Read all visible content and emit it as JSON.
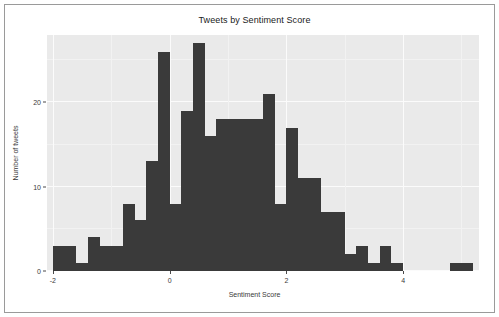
{
  "chart_data": {
    "type": "bar",
    "title": "Tweets by Sentiment Score",
    "xlabel": "Sentiment Score",
    "ylabel": "Number of tweets",
    "grid": true,
    "legend": null,
    "xlim": [
      -2.1,
      5.3
    ],
    "ylim": [
      0,
      28
    ],
    "xticks": [
      -2,
      0,
      2,
      4
    ],
    "xticklabels": [
      "-2",
      "0",
      "2",
      "4"
    ],
    "yticks": [
      0,
      10,
      20
    ],
    "yticklabels": [
      "0",
      "10",
      "20"
    ],
    "bin_width": 0.2,
    "bin_starts": [
      -2.0,
      -1.8,
      -1.6,
      -1.4,
      -1.2,
      -1.0,
      -0.8,
      -0.6,
      -0.4,
      -0.2,
      0.0,
      0.2,
      0.4,
      0.6,
      0.8,
      1.0,
      1.2,
      1.4,
      1.6,
      1.8,
      2.0,
      2.2,
      2.4,
      2.6,
      2.8,
      3.0,
      3.2,
      3.4,
      3.6,
      3.8,
      4.0,
      4.2,
      4.4,
      4.6,
      4.8,
      5.0
    ],
    "values": [
      3,
      3,
      1,
      4,
      3,
      3,
      8,
      6,
      13,
      26,
      8,
      19,
      27,
      16,
      18,
      18,
      18,
      18,
      21,
      8,
      17,
      11,
      11,
      7,
      7,
      2,
      3,
      1,
      3,
      1,
      0,
      0,
      0,
      0,
      1,
      1
    ],
    "categories": [
      "-2.0",
      "-1.8",
      "-1.6",
      "-1.4",
      "-1.2",
      "-1.0",
      "-0.8",
      "-0.6",
      "-0.4",
      "-0.2",
      "0.0",
      "0.2",
      "0.4",
      "0.6",
      "0.8",
      "1.0",
      "1.2",
      "1.4",
      "1.6",
      "1.8",
      "2.0",
      "2.2",
      "2.4",
      "2.6",
      "2.8",
      "3.0",
      "3.2",
      "3.4",
      "3.6",
      "3.8",
      "4.0",
      "4.2",
      "4.4",
      "4.6",
      "4.8",
      "5.0"
    ],
    "bar_color": "#3a3a3a",
    "panel_color": "#eaeaea",
    "grid_color": "#fbfbfb"
  }
}
